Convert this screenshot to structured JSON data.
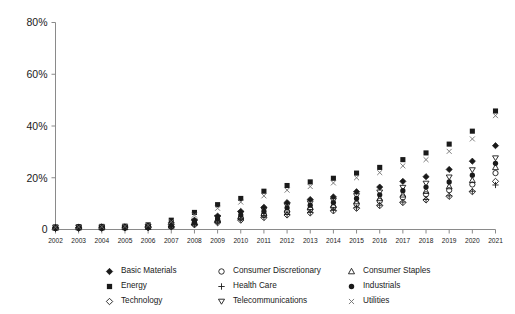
{
  "chart_data": {
    "type": "scatter",
    "title": "",
    "xlabel": "",
    "ylabel": "",
    "ylim": [
      0,
      80
    ],
    "yticks": [
      0,
      20,
      40,
      60,
      80
    ],
    "ytick_labels": [
      "0",
      "20%",
      "40%",
      "60%",
      "80%"
    ],
    "grid": false,
    "legend_position": "bottom",
    "legend_columns": 3,
    "categories": [
      2002,
      2003,
      2004,
      2005,
      2006,
      2007,
      2008,
      2009,
      2010,
      2011,
      2012,
      2013,
      2014,
      2015,
      2016,
      2017,
      2018,
      2019,
      2020,
      2021
    ],
    "series": [
      {
        "name": "Basic Materials",
        "marker": "filled-diamond",
        "color": "#1a1a1a",
        "values": [
          0.8,
          0.9,
          1.0,
          1.0,
          1.2,
          2.0,
          3.6,
          5.2,
          7.0,
          8.6,
          10.4,
          11.6,
          12.6,
          14.6,
          16.4,
          18.6,
          20.4,
          23.2,
          26.4,
          32.4
        ]
      },
      {
        "name": "Energy",
        "marker": "filled-square",
        "color": "#1a1a1a",
        "values": [
          1.0,
          1.1,
          1.2,
          1.3,
          1.8,
          3.6,
          6.6,
          9.6,
          12.0,
          14.8,
          17.0,
          18.4,
          19.8,
          21.8,
          24.0,
          27.0,
          29.6,
          33.0,
          38.0,
          45.8
        ]
      },
      {
        "name": "Technology",
        "marker": "open-diamond",
        "color": "#1a1a1a",
        "values": [
          0.4,
          0.5,
          0.5,
          0.6,
          0.7,
          1.0,
          1.8,
          2.6,
          3.6,
          4.6,
          5.6,
          6.4,
          7.2,
          8.2,
          9.2,
          10.4,
          11.4,
          12.8,
          14.6,
          18.6
        ]
      },
      {
        "name": "Consumer Discretionary",
        "marker": "open-circle",
        "color": "#1a1a1a",
        "values": [
          0.5,
          0.6,
          0.6,
          0.7,
          0.8,
          1.2,
          2.2,
          3.2,
          4.4,
          5.6,
          6.8,
          7.8,
          8.6,
          9.8,
          11.0,
          12.4,
          13.6,
          15.2,
          17.4,
          21.8
        ]
      },
      {
        "name": "Health Care",
        "marker": "plus",
        "color": "#1a1a1a",
        "values": [
          0.5,
          0.5,
          0.6,
          0.6,
          0.7,
          1.1,
          1.9,
          2.8,
          3.8,
          4.8,
          5.8,
          6.6,
          7.4,
          8.4,
          9.4,
          10.6,
          11.6,
          13.0,
          14.8,
          17.2
        ]
      },
      {
        "name": "Telecommunications",
        "marker": "down-triangle",
        "color": "#1a1a1a",
        "values": [
          0.7,
          0.8,
          0.9,
          0.9,
          1.1,
          1.8,
          3.2,
          4.6,
          6.2,
          7.6,
          9.2,
          10.2,
          11.2,
          13.0,
          14.4,
          16.2,
          17.8,
          20.2,
          23.0,
          27.6
        ]
      },
      {
        "name": "Consumer Staples",
        "marker": "open-triangle",
        "color": "#1a1a1a",
        "values": [
          0.6,
          0.7,
          0.7,
          0.8,
          0.9,
          1.4,
          2.6,
          3.8,
          5.0,
          6.2,
          7.6,
          8.6,
          9.4,
          10.8,
          12.0,
          13.4,
          14.8,
          16.6,
          19.0,
          24.0
        ]
      },
      {
        "name": "Industrials",
        "marker": "filled-circle",
        "color": "#1a1a1a",
        "values": [
          0.7,
          0.8,
          0.8,
          0.9,
          1.0,
          1.6,
          2.9,
          4.2,
          5.6,
          7.0,
          8.4,
          9.4,
          10.4,
          12.0,
          13.4,
          15.0,
          16.4,
          18.4,
          21.0,
          25.6
        ]
      },
      {
        "name": "Utilities",
        "marker": "cross",
        "color": "#6f6f6f",
        "values": [
          0.9,
          1.0,
          1.1,
          1.2,
          1.6,
          3.0,
          5.6,
          8.2,
          10.6,
          13.0,
          15.2,
          16.6,
          18.0,
          20.0,
          22.0,
          24.6,
          27.0,
          30.2,
          35.0,
          44.0
        ]
      }
    ]
  },
  "legend": {
    "items": [
      {
        "label": "Basic Materials",
        "marker": "filled-diamond"
      },
      {
        "label": "Consumer Discretionary",
        "marker": "open-circle"
      },
      {
        "label": "Consumer Staples",
        "marker": "open-triangle"
      },
      {
        "label": "Energy",
        "marker": "filled-square"
      },
      {
        "label": "Health Care",
        "marker": "plus"
      },
      {
        "label": "Industrials",
        "marker": "filled-circle"
      },
      {
        "label": "Technology",
        "marker": "open-diamond"
      },
      {
        "label": "Telecommunications",
        "marker": "down-triangle"
      },
      {
        "label": "Utilities",
        "marker": "cross"
      }
    ]
  },
  "colors": {
    "ink": "#1a1a1a",
    "axis": "#8a8a8a",
    "utilities": "#6f6f6f",
    "background": "#ffffff"
  }
}
